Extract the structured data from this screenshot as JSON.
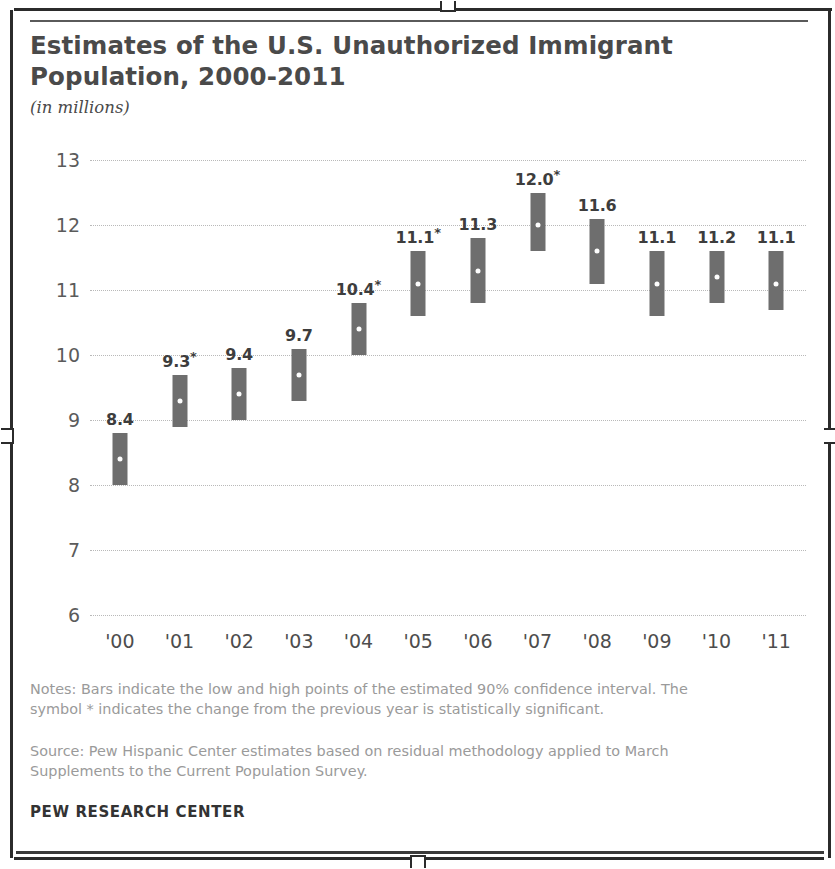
{
  "header": {
    "title": "Estimates of the U.S. Unauthorized Immigrant\nPopulation, 2000-2011",
    "subtitle": "(in millions)"
  },
  "footer": {
    "notes": "Notes: Bars indicate the low and high points of the estimated 90% confidence interval. The symbol * indicates the change from the previous year is statistically significant.",
    "source": "Source: Pew Hispanic Center estimates based on residual methodology applied to March Supplements to the Current Population Survey.",
    "brand": "PEW RESEARCH CENTER"
  },
  "colors": {
    "bar": "#6e6e6e",
    "gridline": "#b9b9b9",
    "title": "#4a4a4a",
    "note": "#9a9a9a",
    "marker": "#fdfdfd"
  },
  "chart_data": {
    "type": "bar",
    "title": "Estimates of the U.S. Unauthorized Immigrant Population, 2000-2011",
    "subtitle": "(in millions)",
    "xlabel": "",
    "ylabel": "in millions",
    "ylim": [
      6,
      13
    ],
    "yticks": [
      13,
      12,
      11,
      10,
      9,
      8,
      7,
      6
    ],
    "ytick_labels": [
      "13",
      "12",
      "11",
      "10",
      "9",
      "8",
      "7",
      "6"
    ],
    "grid": true,
    "legend": "none",
    "categories": [
      "'00",
      "'01",
      "'02",
      "'03",
      "'04",
      "'05",
      "'06",
      "'07",
      "'08",
      "'09",
      "'10",
      "'11"
    ],
    "years": [
      2000,
      2001,
      2002,
      2003,
      2004,
      2005,
      2006,
      2007,
      2008,
      2009,
      2010,
      2011
    ],
    "values": [
      8.4,
      9.3,
      9.4,
      9.7,
      10.4,
      11.1,
      11.3,
      12.0,
      11.6,
      11.1,
      11.2,
      11.1
    ],
    "data_labels": [
      "8.4",
      "9.3*",
      "9.4",
      "9.7",
      "10.4*",
      "11.1*",
      "11.3",
      "12.0*",
      "11.6",
      "11.1",
      "11.2",
      "11.1"
    ],
    "significant": [
      false,
      true,
      false,
      false,
      true,
      true,
      false,
      true,
      false,
      false,
      false,
      false
    ],
    "ci_low": [
      8.0,
      8.9,
      9.0,
      9.3,
      10.0,
      10.6,
      10.8,
      11.6,
      11.1,
      10.6,
      10.8,
      10.7
    ],
    "ci_high": [
      8.8,
      9.7,
      9.8,
      10.1,
      10.8,
      11.6,
      11.8,
      12.5,
      12.1,
      11.6,
      11.6,
      11.6
    ],
    "ci_level": "90%",
    "annotations": [
      "* indicates the change from the previous year is statistically significant"
    ]
  }
}
